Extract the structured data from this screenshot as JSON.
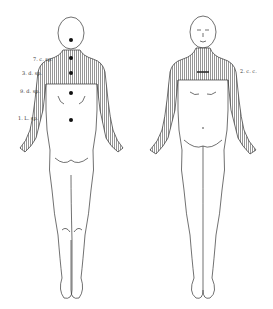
{
  "figure": {
    "type": "anatomical dermatome diagram",
    "views": [
      {
        "name": "posterior",
        "labels": [
          {
            "text": "7. c. sp.",
            "x": 33,
            "y": 59
          },
          {
            "text": "3. d. sp.",
            "x": 22,
            "y": 73
          },
          {
            "text": "9. d. sp.",
            "x": 20,
            "y": 91
          },
          {
            "text": "1. L. sp.",
            "x": 18,
            "y": 118
          }
        ]
      },
      {
        "name": "anterior",
        "labels": [
          {
            "text": "2. c. c.",
            "x": 240,
            "y": 71
          }
        ]
      }
    ],
    "colors": {
      "shading": "#9a9a9a",
      "line": "#333333",
      "background": "#ffffff"
    }
  }
}
